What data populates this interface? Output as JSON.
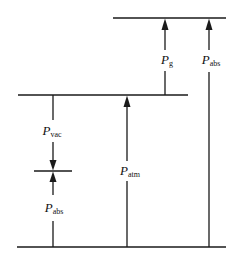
{
  "diagram": {
    "line_color": "#1a1a1a",
    "levels": [
      {
        "name": "top-level",
        "y": 18,
        "x1": 113,
        "x2": 226
      },
      {
        "name": "atmospheric-level",
        "y": 95,
        "x1": 18,
        "x2": 188
      },
      {
        "name": "vacuum-level",
        "y": 171,
        "x1": 34,
        "x2": 72
      },
      {
        "name": "absolute-zero-level",
        "y": 247,
        "x1": 17,
        "x2": 226
      }
    ],
    "labels": {
      "p_g": {
        "symbol": "P",
        "sub": "g"
      },
      "p_abs_right": {
        "symbol": "P",
        "sub": "abs"
      },
      "p_vac": {
        "symbol": "P",
        "sub": "vac"
      },
      "p_abs_left": {
        "symbol": "P",
        "sub": "abs"
      },
      "p_atm": {
        "symbol": "P",
        "sub": "atm"
      }
    }
  }
}
